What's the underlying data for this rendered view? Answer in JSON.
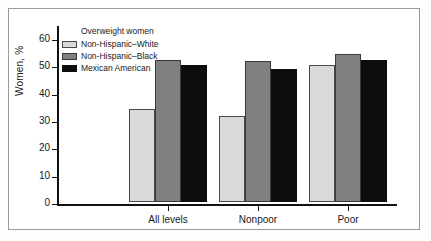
{
  "chart_data": {
    "type": "bar",
    "title": "",
    "legend_title": "Overweight women",
    "legend_position": "top-left-inside",
    "categories": [
      "All levels",
      "Nonpoor",
      "Poor"
    ],
    "series": [
      {
        "name": "Non-Hispanic–White",
        "color": "#d9d9d9",
        "values": [
          34,
          31.5,
          50
        ]
      },
      {
        "name": "Non-Hispanic–Black",
        "color": "#808080",
        "values": [
          52,
          51.5,
          54
        ]
      },
      {
        "name": "Mexican American",
        "color": "#0d0d0d",
        "values": [
          50,
          48.5,
          52
        ]
      }
    ],
    "xlabel": "",
    "ylabel": "Women, %",
    "ylim": [
      0,
      60
    ],
    "yticks": [
      0,
      10,
      20,
      30,
      40,
      50,
      60
    ],
    "ytick_labels": [
      "0",
      "10",
      "20",
      "30",
      "40",
      "50",
      "60"
    ],
    "grid": false
  },
  "figure": {
    "border_color": "#9a9a9a",
    "background": "#ffffff",
    "axis_color": "#111111"
  }
}
